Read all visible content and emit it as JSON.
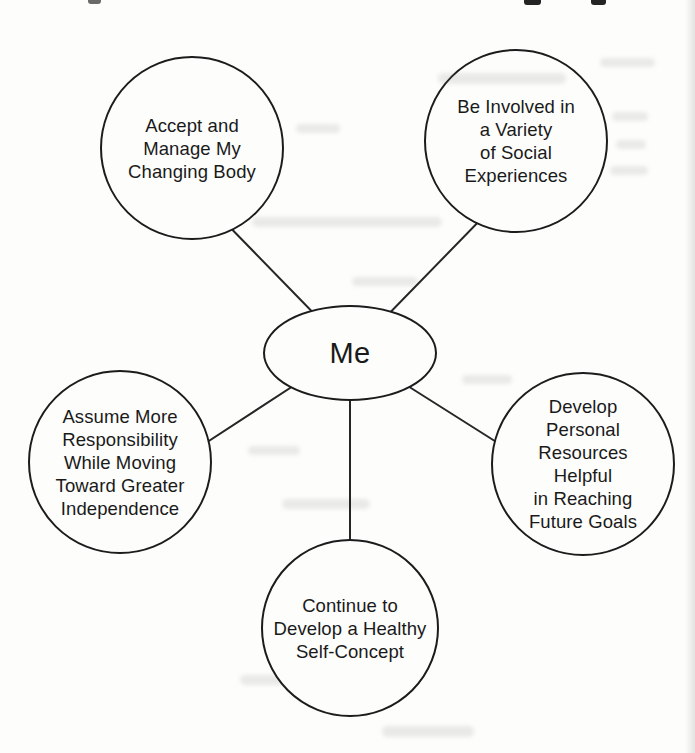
{
  "page": {
    "background_color": "#fdfdfc",
    "ink_color": "#1c1c1c"
  },
  "diagram": {
    "type": "spider-concept-map",
    "center_node": {
      "label": "Me"
    },
    "nodes": [
      {
        "id": "changing-body",
        "position": "top-left",
        "label": "Accept and\nManage My\nChanging Body"
      },
      {
        "id": "social-experiences",
        "position": "top-right",
        "label": "Be Involved in\na Variety\nof Social\nExperiences"
      },
      {
        "id": "independence",
        "position": "left",
        "label": "Assume More\nResponsibility\nWhile Moving\nToward Greater\nIndependence"
      },
      {
        "id": "personal-resources",
        "position": "right",
        "label": "Develop\nPersonal\nResources\nHelpful\nin Reaching\nFuture Goals"
      },
      {
        "id": "self-concept",
        "position": "bottom",
        "label": "Continue to\nDevelop a Healthy\nSelf-Concept"
      }
    ],
    "connector_count": 5
  }
}
